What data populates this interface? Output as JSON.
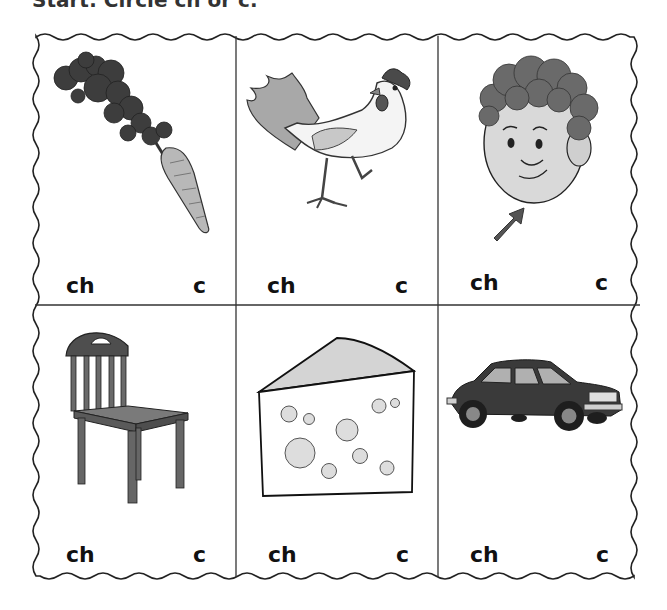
{
  "instruction": "Start: Circle ch or c.",
  "worksheet": {
    "cells": [
      {
        "picture": "carrot",
        "choices": [
          "ch",
          "c"
        ]
      },
      {
        "picture": "chicken",
        "choices": [
          "ch",
          "c"
        ]
      },
      {
        "picture": "chin",
        "choices": [
          "ch",
          "c"
        ]
      },
      {
        "picture": "chair",
        "choices": [
          "ch",
          "c"
        ]
      },
      {
        "picture": "cheese",
        "choices": [
          "ch",
          "c"
        ]
      },
      {
        "picture": "car",
        "choices": [
          "ch",
          "c"
        ]
      }
    ]
  },
  "colors": {
    "border": "#222222",
    "text": "#111111",
    "carrot_greens": "#3d3d3d",
    "carrot_body": "#b8b8b8",
    "chicken_body": "#f4f4f4",
    "chicken_comb": "#4a4a4a",
    "hair": "#6a6a6a",
    "skin": "#d9d9d9",
    "chair": "#5a5a5a",
    "cheese_top": "#d4d4d4",
    "car_body": "#3a3a3a"
  }
}
